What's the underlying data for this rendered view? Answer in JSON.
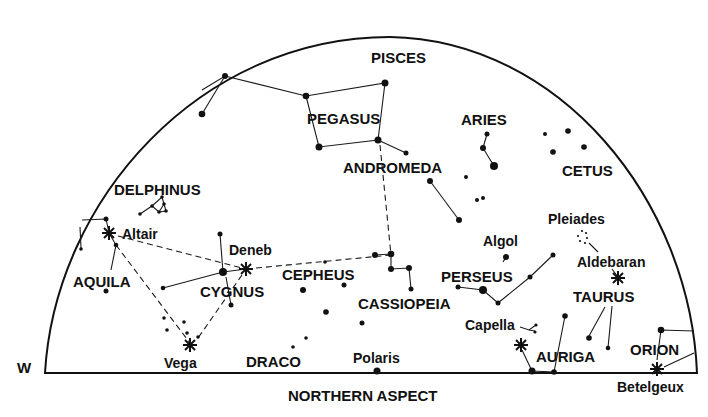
{
  "chart": {
    "title": "NORTHERN ASPECT",
    "direction_left": "W",
    "constellations": {
      "pisces": "PISCES",
      "pegasus": "PEGASUS",
      "aries": "ARIES",
      "andromeda": "ANDROMEDA",
      "cetus": "CETUS",
      "delphinus": "DELPHINUS",
      "aquila": "AQUILA",
      "cygnus": "CYGNUS",
      "cepheus": "CEPHEUS",
      "cassiopeia": "CASSIOPEIA",
      "perseus": "PERSEUS",
      "taurus": "TAURUS",
      "auriga": "AURIGA",
      "orion": "ORION",
      "draco": "DRACO"
    },
    "stars": {
      "altair": "Altair",
      "deneb": "Deneb",
      "vega": "Vega",
      "polaris": "Polaris",
      "algol": "Algol",
      "pleiades": "Pleiades",
      "aldebaran": "Aldebaran",
      "capella": "Capella",
      "betelgeux": "Betelgeux"
    },
    "colors": {
      "ink": "#111111",
      "background": "#ffffff"
    }
  }
}
